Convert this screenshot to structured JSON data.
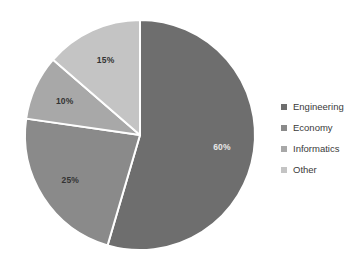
{
  "chart_data": {
    "type": "pie",
    "title": "",
    "categories": [
      "Engineering",
      "Economy",
      "Informatics",
      "Other"
    ],
    "values": [
      60,
      25,
      10,
      15
    ],
    "data_labels": [
      "60%",
      "25%",
      "10%",
      "15%"
    ],
    "colors": [
      "#6e6e6e",
      "#8a8a8a",
      "#a8a8a8",
      "#c4c4c4"
    ],
    "label_colors": [
      "#e8e8e8",
      "#333333",
      "#333333",
      "#333333"
    ],
    "legend": {
      "position": "right",
      "entries": [
        {
          "label": "Engineering",
          "color": "#6e6e6e"
        },
        {
          "label": "Economy",
          "color": "#8a8a8a"
        },
        {
          "label": "Informatics",
          "color": "#a8a8a8"
        },
        {
          "label": "Other",
          "color": "#c4c4c4"
        }
      ]
    },
    "geometry": {
      "center_x": 140,
      "center_y": 135,
      "radius": 115,
      "start_angle_deg": -90,
      "direction": "clockwise",
      "separator_color": "#ffffff",
      "separator_width": 2
    },
    "grid": false,
    "xlabel": "",
    "ylabel": ""
  }
}
